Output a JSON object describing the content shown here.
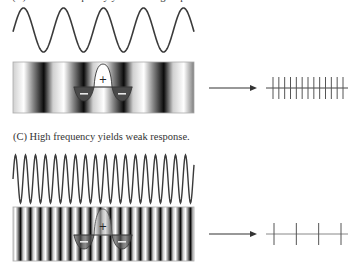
{
  "panels": [
    {
      "id": "B",
      "caption": "(B) Medium frequency yields strong response.",
      "wave": {
        "period_px": 40,
        "cycles": 4.5
      },
      "receptive_field": {
        "center_sign": "+",
        "surround_sign": "−"
      },
      "response": {
        "spike_count": 13,
        "strength": "strong"
      }
    },
    {
      "id": "C",
      "caption": "(C) High frequency yields weak response.",
      "wave": {
        "period_px": 10,
        "cycles": 18
      },
      "receptive_field": {
        "center_sign": "+",
        "surround_sign": "−"
      },
      "response": {
        "spike_count": 4,
        "strength": "weak"
      }
    }
  ],
  "colors": {
    "wave": "#3a3a3a",
    "arrow": "#333333",
    "spike": "#555555",
    "spike_line_weak": "#888888",
    "minus_fill": "#4a4a4a"
  }
}
